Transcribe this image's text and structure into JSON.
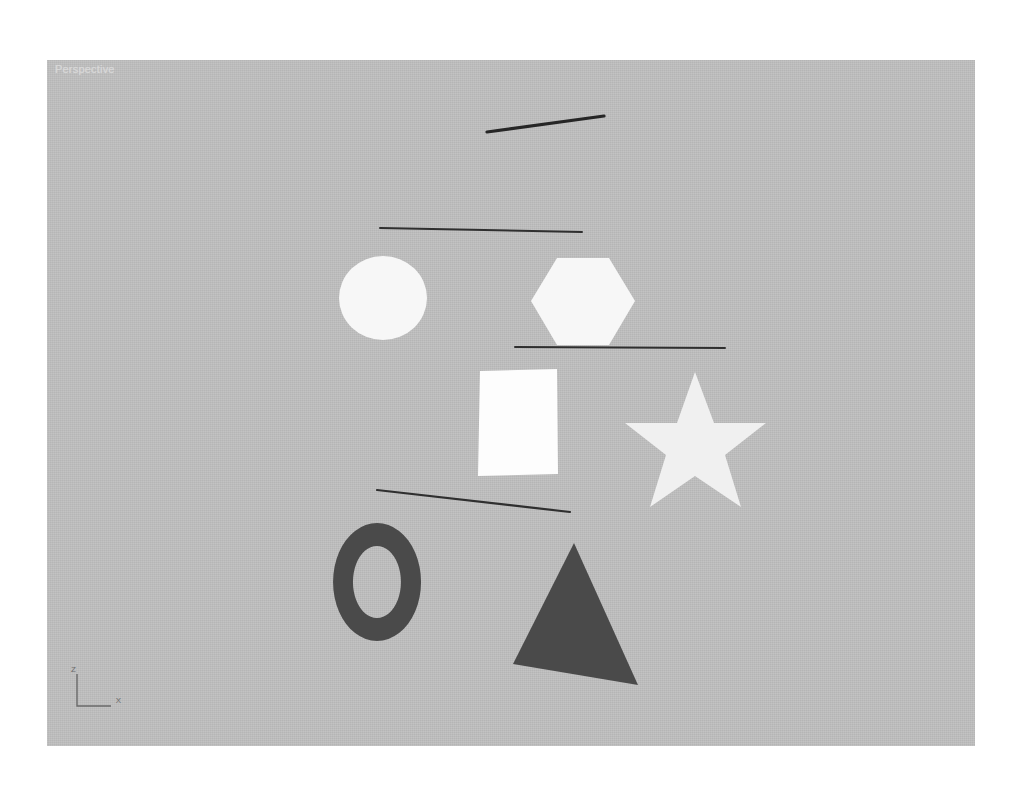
{
  "window": {
    "page_background": "#ffffff"
  },
  "viewport": {
    "label": "Perspective",
    "background_color": "#bfbfbf",
    "label_color": "#d8d8d8",
    "bounds": {
      "x": 47,
      "y": 60,
      "width": 928,
      "height": 686
    }
  },
  "axis_tripod": {
    "name": "axis-tripod",
    "axes": [
      {
        "label": "Z",
        "direction": "up"
      },
      {
        "label": "X",
        "direction": "right"
      }
    ],
    "color": "#6a6a6a"
  },
  "scene": {
    "colors": {
      "light_fill": "#f7f7f7",
      "white_fill": "#fdfdfd",
      "star_fill": "#f0f0f0",
      "dark_fill": "#4a4a4a",
      "line_stroke": "#2b2b2b"
    },
    "objects": [
      {
        "name": "line-diagonal",
        "type": "line",
        "label": "Line",
        "stroke": "#262626",
        "stroke_width": 3,
        "points": "440,72 557,56"
      },
      {
        "name": "line-horizontal-top",
        "type": "line",
        "label": "Line",
        "stroke": "#2b2b2b",
        "stroke_width": 2,
        "points": "333,168 535,172"
      },
      {
        "name": "line-horizontal-middle",
        "type": "line",
        "label": "Line",
        "stroke": "#2b2b2b",
        "stroke_width": 2,
        "points": "468,287 678,288"
      },
      {
        "name": "line-horizontal-bottom",
        "type": "line",
        "label": "Line",
        "stroke": "#2b2b2b",
        "stroke_width": 2,
        "points": "330,430 523,452"
      },
      {
        "name": "shape-circle",
        "type": "circle",
        "label": "Circle",
        "fill": "#f7f7f7",
        "cx": 336,
        "cy": 238,
        "rx": 44,
        "ry": 42
      },
      {
        "name": "shape-hexagon",
        "type": "ngon",
        "label": "NGon",
        "sides": 6,
        "fill": "#f7f7f7",
        "points": "510,198 562,198 588,241 562,285 510,285 484,241"
      },
      {
        "name": "shape-rectangle",
        "type": "rectangle",
        "label": "Rectangle",
        "fill": "#fdfdfd",
        "points": "433,311 510,309 511,414 431,416"
      },
      {
        "name": "shape-star",
        "type": "star",
        "label": "Star",
        "points_count": 6,
        "fill": "#f0f0f0",
        "points": "648,312 667,363 719,363 678,395 694,447 648,416 603,447 619,395 578,363 630,363"
      },
      {
        "name": "shape-donut",
        "type": "donut",
        "label": "Donut",
        "fill": "#4a4a4a",
        "cx": 330,
        "cy": 522,
        "rx_outer": 44,
        "ry_outer": 59,
        "rx_inner": 24,
        "ry_inner": 36
      },
      {
        "name": "shape-triangle",
        "type": "ngon",
        "label": "NGon",
        "sides": 3,
        "fill": "#4a4a4a",
        "points": "527,483 591,625 466,604"
      }
    ]
  }
}
